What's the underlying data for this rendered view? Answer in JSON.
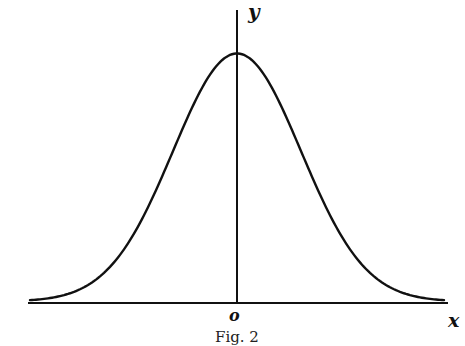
{
  "chart_data": {
    "type": "line",
    "title": "",
    "caption": "Fig. 2",
    "xlabel": "x",
    "ylabel": "y",
    "origin_label": "o",
    "grid": false,
    "legend": null,
    "series": [
      {
        "name": "y = e^(-x^2/2)",
        "x": [
          -3.2,
          -3,
          -2.5,
          -2,
          -1.5,
          -1,
          -0.5,
          0,
          0.5,
          1,
          1.5,
          2,
          2.5,
          3,
          3.2
        ],
        "values": [
          0.006,
          0.011,
          0.044,
          0.135,
          0.325,
          0.607,
          0.882,
          1.0,
          0.882,
          0.607,
          0.325,
          0.135,
          0.044,
          0.011,
          0.006
        ]
      }
    ],
    "xlim": [
      -3.3,
      3.3
    ],
    "ylim": [
      0,
      1.15
    ],
    "ink_color": "#111111",
    "background": "#ffffff"
  }
}
